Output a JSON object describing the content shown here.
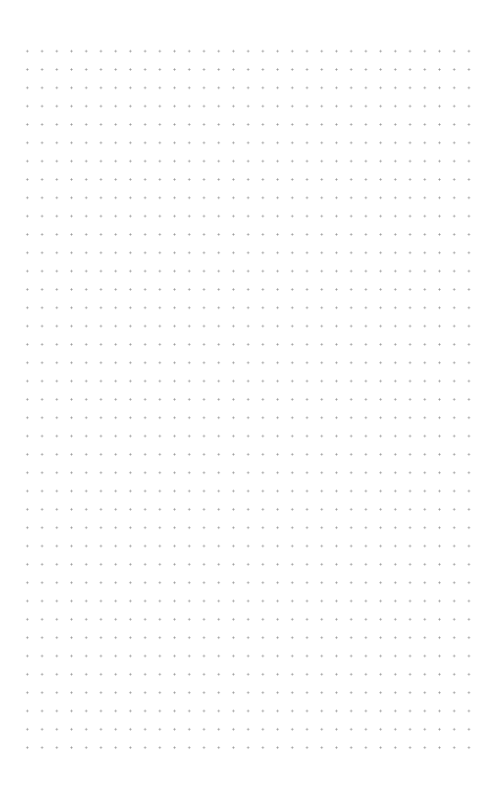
{
  "page": {
    "type": "dot-grid-paper",
    "background_color": "#ffffff",
    "dot_color": "#9a9a9a",
    "grid": {
      "columns": 31,
      "rows": 39,
      "horizontal_spacing_px": 14.73,
      "vertical_spacing_px": 18.33,
      "first_dot_x": 27,
      "first_dot_y": 51
    }
  }
}
